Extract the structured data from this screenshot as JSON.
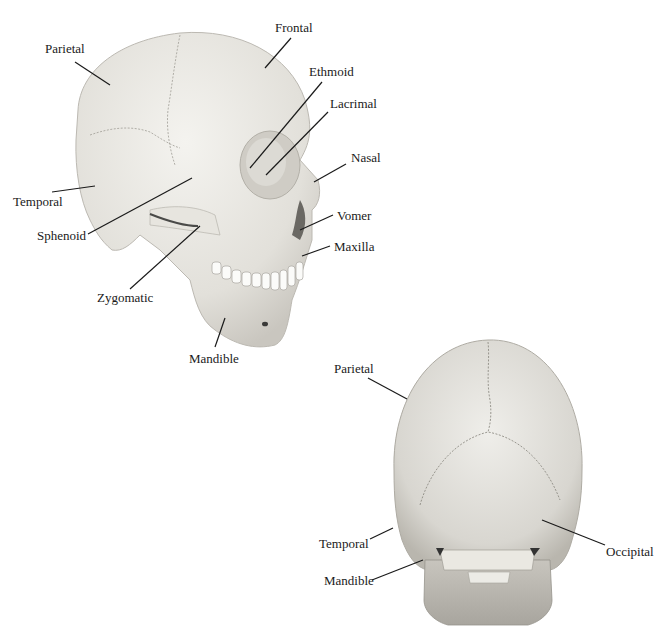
{
  "figure": {
    "lateral_view": {
      "labels": [
        {
          "id": "parietal",
          "text": "Parietal",
          "x": 45,
          "y": 42
        },
        {
          "id": "frontal",
          "text": "Frontal",
          "x": 275,
          "y": 21
        },
        {
          "id": "ethmoid",
          "text": "Ethmoid",
          "x": 309,
          "y": 65
        },
        {
          "id": "lacrimal",
          "text": "Lacrimal",
          "x": 330,
          "y": 97
        },
        {
          "id": "nasal",
          "text": "Nasal",
          "x": 351,
          "y": 151
        },
        {
          "id": "temporal",
          "text": "Temporal",
          "x": 13,
          "y": 195
        },
        {
          "id": "sphenoid",
          "text": "Sphenoid",
          "x": 37,
          "y": 229
        },
        {
          "id": "vomer",
          "text": "Vomer",
          "x": 337,
          "y": 209
        },
        {
          "id": "maxilla",
          "text": "Maxilla",
          "x": 334,
          "y": 240
        },
        {
          "id": "zygomatic",
          "text": "Zygomatic",
          "x": 97,
          "y": 291
        },
        {
          "id": "mandible",
          "text": "Mandible",
          "x": 189,
          "y": 352
        }
      ]
    },
    "posterior_view": {
      "labels": [
        {
          "id": "parietal",
          "text": "Parietal",
          "x": 334,
          "y": 362
        },
        {
          "id": "temporal",
          "text": "Temporal",
          "x": 319,
          "y": 537
        },
        {
          "id": "occipital",
          "text": "Occipital",
          "x": 606,
          "y": 545
        },
        {
          "id": "mandible",
          "text": "Mandible",
          "x": 324,
          "y": 574
        }
      ]
    }
  }
}
